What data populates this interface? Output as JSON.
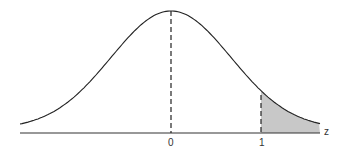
{
  "figure": {
    "type": "standard normal distribution curve with shaded right tail",
    "axis_label": "z",
    "tick_labels": [
      "0",
      "1"
    ],
    "shaded_region": "z > 1",
    "colors": {
      "curve": "#222222",
      "shade": "#c8c8c8",
      "axis": "#333333"
    }
  }
}
